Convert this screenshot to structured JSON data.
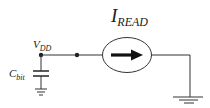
{
  "diagram": {
    "type": "circuit-schematic",
    "labels": {
      "current_source": {
        "main": "I",
        "sub": "READ"
      },
      "supply_node": {
        "main": "V",
        "sub": "DD"
      },
      "capacitor": {
        "main": "C",
        "sub": "bit"
      }
    },
    "components": [
      {
        "id": "cbit",
        "kind": "capacitor",
        "label": "C_bit"
      },
      {
        "id": "iread",
        "kind": "current-source",
        "direction": "right",
        "label": "I_READ"
      },
      {
        "id": "gnd1",
        "kind": "ground",
        "under": "cbit"
      },
      {
        "id": "gnd2",
        "kind": "ground",
        "under": "iread-output"
      }
    ],
    "colors": {
      "line": "#333333",
      "background": "#ffffff"
    }
  }
}
